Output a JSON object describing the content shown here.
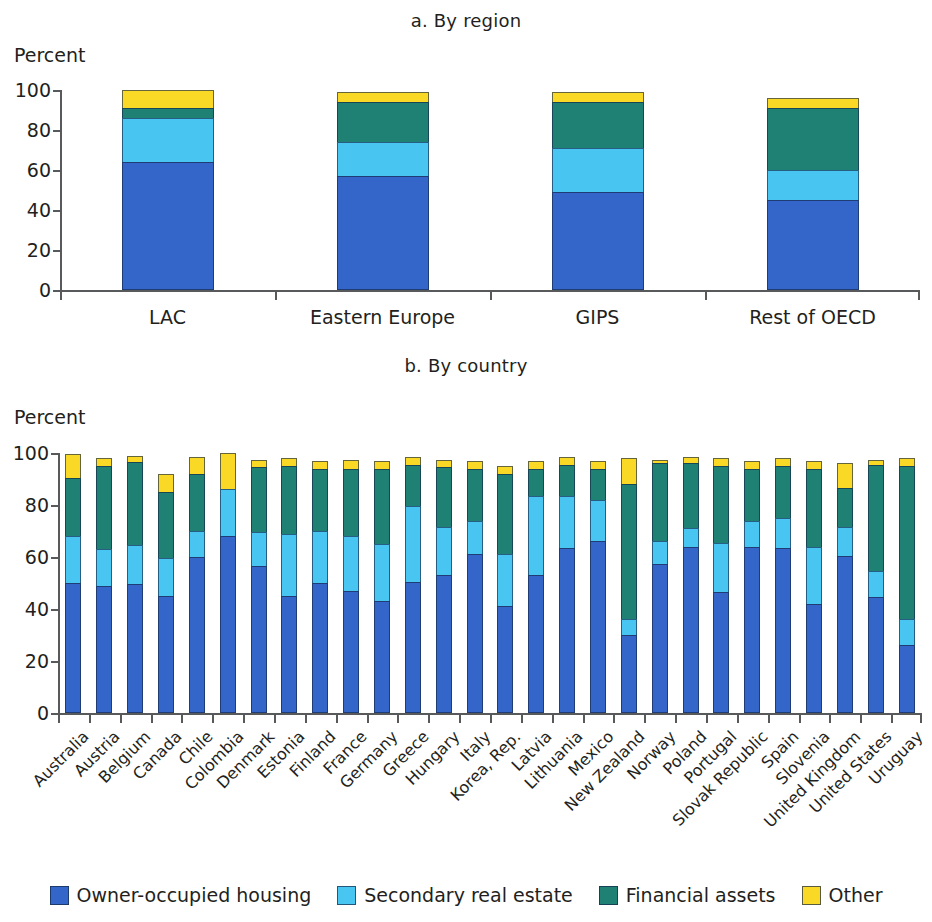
{
  "figure": {
    "panel_a_title": "a. By region",
    "panel_b_title": "b. By country",
    "y_axis_unit": "Percent"
  },
  "legend": {
    "items": [
      {
        "label": "Owner-occupied housing",
        "color": "#3465c8"
      },
      {
        "label": "Secondary real estate",
        "color": "#49c5f2"
      },
      {
        "label": "Financial assets",
        "color": "#1f8074"
      },
      {
        "label": "Other",
        "color": "#fad826"
      }
    ]
  },
  "chart_data": [
    {
      "type": "bar",
      "title": "a. By region",
      "stacked": true,
      "xlabel": "",
      "ylabel": "Percent",
      "ylim": [
        0,
        100
      ],
      "yticks": [
        0,
        20,
        40,
        60,
        80,
        100
      ],
      "grid": false,
      "legend_position": "bottom",
      "categories": [
        "LAC",
        "Eastern Europe",
        "GIPS",
        "Rest of OECD"
      ],
      "series": [
        {
          "name": "Owner-occupied housing",
          "color": "#3465c8",
          "values": [
            64,
            57,
            49,
            45
          ]
        },
        {
          "name": "Secondary real estate",
          "color": "#49c5f2",
          "values": [
            22,
            17,
            22,
            15
          ]
        },
        {
          "name": "Financial assets",
          "color": "#1f8074",
          "values": [
            5,
            20,
            23,
            31
          ]
        },
        {
          "name": "Other",
          "color": "#fad826",
          "values": [
            9,
            5,
            5,
            5
          ]
        }
      ],
      "totals": [
        100,
        99,
        99,
        96
      ]
    },
    {
      "type": "bar",
      "title": "b. By country",
      "stacked": true,
      "xlabel": "",
      "ylabel": "Percent",
      "ylim": [
        0,
        100
      ],
      "yticks": [
        0,
        20,
        40,
        60,
        80,
        100
      ],
      "grid": false,
      "legend_position": "bottom",
      "categories": [
        "Australia",
        "Austria",
        "Belgium",
        "Canada",
        "Chile",
        "Colombia",
        "Denmark",
        "Estonia",
        "Finland",
        "France",
        "Germany",
        "Greece",
        "Hungary",
        "Italy",
        "Korea, Rep.",
        "Latvia",
        "Lithuania",
        "Mexico",
        "New Zealand",
        "Norway",
        "Poland",
        "Portugal",
        "Slovak Republic",
        "Spain",
        "Slovenia",
        "United Kingdom",
        "United States",
        "Uruguay"
      ],
      "series": [
        {
          "name": "Owner-occupied housing",
          "color": "#3465c8",
          "values": [
            50,
            49,
            49.5,
            45,
            60,
            68,
            56.5,
            45,
            50,
            47,
            43,
            50.5,
            53,
            61,
            41,
            53,
            63.5,
            66,
            30,
            57.5,
            64,
            46.5,
            64,
            63.5,
            42,
            60.5,
            44.5,
            26,
            59
          ]
        },
        {
          "name": "Secondary real estate",
          "color": "#49c5f2",
          "values": [
            18,
            14,
            15,
            14.5,
            10,
            18,
            13,
            24,
            20,
            21,
            22,
            29,
            18.5,
            13,
            20,
            30.5,
            20,
            16,
            6,
            8.5,
            7,
            19,
            10,
            11.5,
            22,
            11,
            10,
            10,
            22
          ]
        },
        {
          "name": "Financial assets",
          "color": "#1f8074",
          "values": [
            22.5,
            32,
            32,
            25.5,
            22,
            0,
            25,
            26,
            24,
            26,
            29,
            16,
            23,
            20,
            31,
            10.5,
            12,
            12,
            52,
            30,
            25,
            29.5,
            20,
            20,
            30,
            15,
            41,
            59,
            11
          ]
        },
        {
          "name": "Other",
          "color": "#fad826",
          "values": [
            9,
            3,
            2.5,
            7,
            6.5,
            14,
            3,
            3,
            3,
            3.5,
            3,
            3,
            3,
            3,
            3,
            3,
            3,
            3,
            10,
            1.5,
            2.5,
            3,
            3,
            3,
            3,
            9.5,
            2,
            3,
            5
          ]
        }
      ]
    }
  ]
}
